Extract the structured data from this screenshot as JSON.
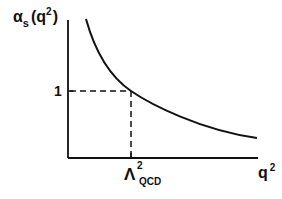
{
  "diagram": {
    "type": "running-coupling-sketch",
    "y_axis_label": {
      "base": "α",
      "sub": "s",
      "arg_open": "(q",
      "arg_sup": "2",
      "arg_close": ")"
    },
    "x_axis_label": {
      "base": "q",
      "sup": "2"
    },
    "y_tick": {
      "label": "1"
    },
    "x_tick": {
      "base": "Λ",
      "sup": "2",
      "sub": "QCD"
    },
    "curve": {
      "description": "monotonically decreasing coupling α_s(q²) vs q²",
      "style": "solid"
    },
    "guides": {
      "style": "dashed",
      "description": "dashed lines marking α_s = 1 at q² = Λ²_QCD"
    },
    "colors": {
      "ink": "#111111",
      "background": "#ffffff"
    }
  }
}
